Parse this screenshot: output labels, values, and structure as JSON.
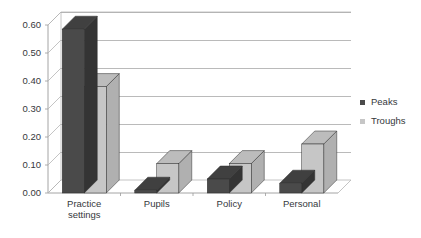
{
  "chart_data": {
    "type": "bar",
    "title": "",
    "subtitle": "",
    "xlabel": "",
    "ylabel": "",
    "categories": [
      "Practice settings",
      "Pupils",
      "Policy",
      "Personal"
    ],
    "series": [
      {
        "name": "Peaks",
        "values": [
          0.585,
          0.01,
          0.05,
          0.035
        ],
        "color": "#4a4a4a"
      },
      {
        "name": "Troughs",
        "values": [
          0.38,
          0.105,
          0.105,
          0.175
        ],
        "color": "#c6c6c6"
      }
    ],
    "ylim": [
      0.0,
      0.6
    ],
    "yticks": [
      0.0,
      0.1,
      0.2,
      0.3,
      0.4,
      0.5,
      0.6
    ],
    "ytick_labels": [
      "0.00",
      "0.10",
      "0.20",
      "0.30",
      "0.40",
      "0.50",
      "0.60"
    ],
    "grid": true,
    "grid_axis": "y",
    "legend_position": "right",
    "style": "3d-column",
    "legend": [
      {
        "label": "Peaks",
        "color": "#4a4a4a"
      },
      {
        "label": "Troughs",
        "color": "#c6c6c6"
      }
    ]
  },
  "axis": {
    "y_tick_labels": [
      "0.60",
      "0.50",
      "0.40",
      "0.30",
      "0.20",
      "0.10",
      "0.00"
    ],
    "x_category_labels": [
      {
        "line1": "Practice",
        "line2": "settings"
      },
      {
        "line1": "Pupils",
        "line2": ""
      },
      {
        "line1": "Policy",
        "line2": ""
      },
      {
        "line1": "Personal",
        "line2": ""
      }
    ]
  },
  "legend": {
    "items": [
      {
        "marker": "square-marker",
        "label": "Peaks"
      },
      {
        "marker": "square-marker",
        "label": "Troughs"
      }
    ]
  },
  "colors": {
    "peaks": "#4a4a4a",
    "peaks_top": "#3a3a3a",
    "peaks_side": "#303030",
    "troughs": "#c6c6c6",
    "troughs_top": "#b4b4b4",
    "troughs_side": "#a8a8a8",
    "gridline": "#a9a9a9",
    "text": "#35383c",
    "background": "#ffffff"
  }
}
